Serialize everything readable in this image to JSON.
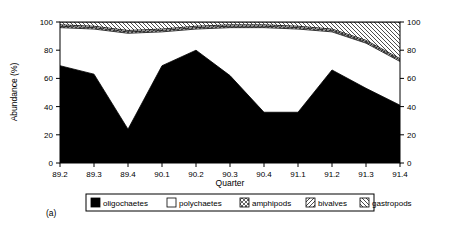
{
  "figure": {
    "panel_label": "(a)",
    "background": "#ffffff",
    "foreground": "#000000"
  },
  "chart_data": {
    "type": "area",
    "subtype": "stacked-percentage",
    "title": "",
    "xlabel": "Quarter",
    "ylabel": "Abundance (%)",
    "categories": [
      "89.2",
      "89.3",
      "89.4",
      "90.1",
      "90.2",
      "90.3",
      "90.4",
      "91.1",
      "91.2",
      "91.3",
      "91.4"
    ],
    "xlim": [
      0,
      10
    ],
    "ylim": [
      0,
      100
    ],
    "yticks": [
      0,
      20,
      40,
      60,
      80,
      100
    ],
    "ytick_labels": [
      "0",
      "20",
      "40",
      "60",
      "80",
      "100"
    ],
    "right_axis": true,
    "right_yticks": [
      0,
      20,
      40,
      60,
      80,
      100
    ],
    "right_ytick_labels": [
      "0",
      "20",
      "40",
      "60",
      "80",
      "100"
    ],
    "grid": false,
    "legend_position": "bottom",
    "series": [
      {
        "name": "oligochaetes",
        "fill": "solid-black",
        "color": "#000000",
        "values": [
          69,
          63,
          24,
          69,
          80,
          62,
          36,
          36,
          66,
          53,
          41
        ]
      },
      {
        "name": "polychaetes",
        "fill": "solid-white",
        "color": "#ffffff",
        "values": [
          27,
          32,
          68,
          24,
          15,
          34,
          60,
          59,
          27,
          32,
          31
        ]
      },
      {
        "name": "amphipods",
        "fill": "cross-hatch",
        "color": "#ffffff",
        "values": [
          1,
          1,
          1,
          1,
          1,
          1,
          1,
          1,
          1,
          1,
          1
        ]
      },
      {
        "name": "bivalves",
        "fill": "backslash-hatch",
        "color": "#ffffff",
        "values": [
          1,
          1,
          1,
          1,
          1,
          1,
          1,
          1,
          1,
          1,
          1
        ]
      },
      {
        "name": "gastropods",
        "fill": "slash-hatch",
        "color": "#ffffff",
        "values": [
          2,
          3,
          6,
          5,
          3,
          2,
          2,
          3,
          5,
          13,
          26
        ]
      }
    ],
    "cumulative_tops": {
      "oligochaetes": [
        69,
        63,
        24,
        69,
        80,
        62,
        36,
        36,
        66,
        53,
        41
      ],
      "polychaetes": [
        96,
        95,
        92,
        93,
        95,
        96,
        96,
        95,
        93,
        85,
        72
      ],
      "amphipods": [
        97,
        96,
        93,
        94,
        96,
        97,
        97,
        96,
        94,
        86,
        73
      ],
      "bivalves": [
        98,
        97,
        94,
        95,
        97,
        98,
        98,
        97,
        95,
        87,
        74
      ],
      "gastropods": [
        100,
        100,
        100,
        100,
        100,
        100,
        100,
        100,
        100,
        100,
        100
      ]
    },
    "legend": [
      {
        "label": "oligochaetes",
        "fill": "solid-black"
      },
      {
        "label": "polychaetes",
        "fill": "solid-white"
      },
      {
        "label": "amphipods",
        "fill": "cross-hatch"
      },
      {
        "label": "bivalves",
        "fill": "backslash-hatch"
      },
      {
        "label": "gastropods",
        "fill": "slash-hatch"
      }
    ]
  }
}
